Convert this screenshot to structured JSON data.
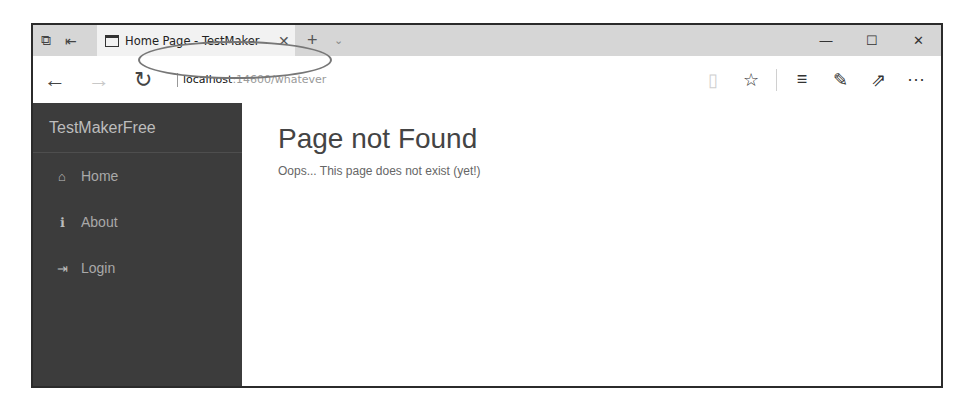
{
  "browser": {
    "tab": {
      "title": "Home Page - TestMaker",
      "close_glyph": "✕"
    },
    "tab_tools": {
      "tab_preview_icon": "⧉",
      "set_aside_icon": "⇤"
    },
    "new_tab_glyph": "+",
    "tab_list_glyph": "⌄",
    "window_controls": {
      "minimize": "—",
      "maximize": "☐",
      "close": "✕"
    },
    "nav": {
      "back": "←",
      "forward": "→",
      "refresh": "↻"
    },
    "address": {
      "host": "localhost",
      "rest": ":14600/whatever"
    },
    "toolbar": {
      "reading_view": "▯",
      "favorite": "☆",
      "hub": "≡",
      "web_note": "✎",
      "share": "⇗",
      "more": "···"
    }
  },
  "sidebar": {
    "brand": "TestMakerFree",
    "items": [
      {
        "label": "Home",
        "icon": "⌂"
      },
      {
        "label": "About",
        "icon": "ℹ"
      },
      {
        "label": "Login",
        "icon": "⇥"
      }
    ]
  },
  "main": {
    "title": "Page not Found",
    "message": "Oops... This page does not exist (yet!)"
  }
}
